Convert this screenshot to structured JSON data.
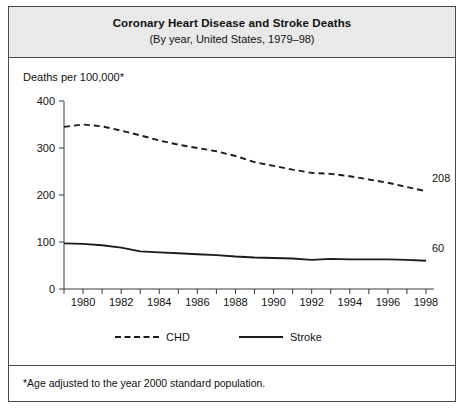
{
  "figure": {
    "title": "Coronary Heart Disease and Stroke Deaths",
    "subtitle": "(By year, United States, 1979–98)",
    "footnote": "*Age adjusted to the year 2000 standard population.",
    "axis_label": "Deaths per 100,000*"
  },
  "chart_data": {
    "type": "line",
    "title": "Coronary Heart Disease and Stroke Deaths",
    "subtitle": "(By year, United States, 1979–98)",
    "xlabel": "",
    "ylabel": "Deaths per 100,000*",
    "footnote": "*Age adjusted to the year 2000 standard population.",
    "xlim": [
      1979,
      1998
    ],
    "ylim": [
      0,
      400
    ],
    "yticks": [
      0,
      100,
      200,
      300,
      400
    ],
    "ytick_labels": [
      "0",
      "100",
      "200",
      "300",
      "400"
    ],
    "xticks": [
      1979,
      1980,
      1981,
      1982,
      1983,
      1984,
      1985,
      1986,
      1987,
      1988,
      1989,
      1990,
      1991,
      1992,
      1993,
      1994,
      1995,
      1996,
      1997,
      1998
    ],
    "xtick_labels_shown": [
      "1980",
      "1982",
      "1984",
      "1986",
      "1988",
      "1990",
      "1992",
      "1994",
      "1996",
      "1998"
    ],
    "grid": false,
    "legend_position": "bottom",
    "x": [
      1979,
      1980,
      1981,
      1982,
      1983,
      1984,
      1985,
      1986,
      1987,
      1988,
      1989,
      1990,
      1991,
      1992,
      1993,
      1994,
      1995,
      1996,
      1997,
      1998
    ],
    "series": [
      {
        "name": "CHD",
        "style": "dashed",
        "color": "#1c1c1c",
        "end_label": "208",
        "values": [
          345,
          350,
          346,
          337,
          327,
          316,
          307,
          300,
          293,
          283,
          270,
          262,
          254,
          247,
          245,
          240,
          233,
          226,
          217,
          208
        ]
      },
      {
        "name": "Stroke",
        "style": "solid",
        "color": "#1c1c1c",
        "end_label": "60",
        "values": [
          97,
          96,
          93,
          88,
          80,
          78,
          76,
          74,
          72,
          69,
          67,
          66,
          65,
          62,
          64,
          63,
          63,
          63,
          62,
          60
        ]
      }
    ],
    "legend": [
      {
        "label": "CHD",
        "style": "dashed"
      },
      {
        "label": "Stroke",
        "style": "solid"
      }
    ],
    "annotations": [
      {
        "text": "208",
        "series": "CHD",
        "x": 1998
      },
      {
        "text": "60",
        "series": "Stroke",
        "x": 1998
      }
    ]
  }
}
